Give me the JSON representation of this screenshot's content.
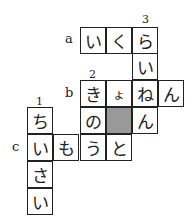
{
  "puzzle": {
    "row_labels": {
      "a": "a",
      "b": "b",
      "c": "c"
    },
    "numbers": {
      "n1": "1",
      "n2": "2",
      "n3": "3"
    },
    "cells": {
      "a1": "い",
      "a2": "く",
      "a3": "ら",
      "r1": "い",
      "b1": "き",
      "b2": "ょ",
      "b3": "ね",
      "b4": "ん",
      "d1": "ち",
      "d2": "の",
      "d3": "",
      "d4": "ん",
      "c1": "い",
      "c2": "も",
      "c3": "う",
      "c4": "と",
      "e1": "さ",
      "f1": "い"
    },
    "shaded_color": "#999999"
  }
}
